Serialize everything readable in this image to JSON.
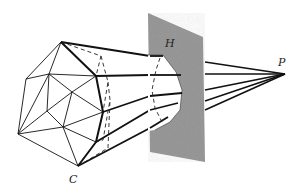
{
  "figure": {
    "labels": {
      "polyhedron": "C",
      "plane": "H",
      "point": "P"
    },
    "colors": {
      "line": "#111111",
      "plane_fill": "#9a9a9a",
      "background": "#ffffff"
    }
  }
}
